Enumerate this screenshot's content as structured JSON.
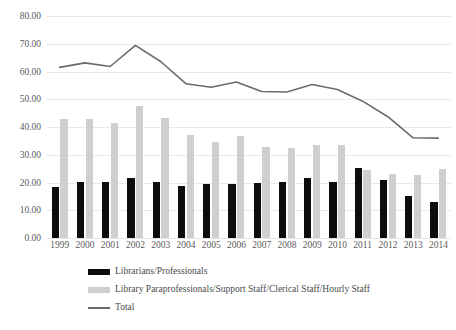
{
  "chart_data": {
    "type": "bar",
    "title": "",
    "subtitle": "",
    "xlabel": "",
    "ylabel": "",
    "ylim": [
      0,
      80
    ],
    "ytick_step": 10,
    "ytick_labels": [
      "0.00",
      "10.00",
      "20.00",
      "30.00",
      "40.00",
      "50.00",
      "60.00",
      "70.00",
      "80.00"
    ],
    "grid": true,
    "legend_position": "bottom-left",
    "categories": [
      "1999",
      "2000",
      "2001",
      "2002",
      "2003",
      "2004",
      "2005",
      "2006",
      "2007",
      "2008",
      "2009",
      "2010",
      "2011",
      "2012",
      "2013",
      "2014"
    ],
    "series": [
      {
        "name": "Librarians/Professionals",
        "type": "bar",
        "color": "#0d0d0d",
        "values": [
          18.5,
          20.3,
          20.3,
          21.7,
          20.3,
          18.6,
          19.6,
          19.6,
          20.0,
          20.3,
          21.8,
          20.1,
          25.2,
          20.8,
          15.2,
          12.8
        ]
      },
      {
        "name": "Library Paraprofessionals/Support Staff/Clerical Staff/Hourly Staff",
        "type": "bar",
        "color": "#cfcfcf",
        "values": [
          43.0,
          42.8,
          41.5,
          47.7,
          43.3,
          37.0,
          34.7,
          36.6,
          32.8,
          32.3,
          33.5,
          33.4,
          24.6,
          23.0,
          22.6,
          24.8
        ]
      },
      {
        "name": "Total",
        "type": "line",
        "color": "#6b6b6b",
        "values": [
          61.5,
          63.1,
          61.8,
          69.4,
          63.6,
          55.6,
          54.3,
          56.2,
          52.8,
          52.6,
          55.3,
          53.5,
          49.3,
          43.7,
          36.1,
          36.0
        ]
      }
    ]
  },
  "legend": {
    "items": [
      {
        "label": "Librarians/Professionals",
        "marker": "black-swatch"
      },
      {
        "label": "Library Paraprofessionals/Support Staff/Clerical Staff/Hourly Staff",
        "marker": "gray-swatch"
      },
      {
        "label": "Total",
        "marker": "line-swatch"
      }
    ]
  }
}
